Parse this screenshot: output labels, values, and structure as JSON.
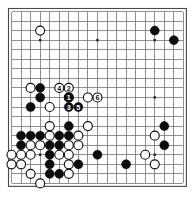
{
  "diagram": {
    "kind": "go-board-diagram",
    "board_size": 19,
    "geometry": {
      "canvas_width": 195,
      "canvas_height": 202,
      "origin_x": 11.5,
      "origin_y": 11.5,
      "step": 9.55,
      "stone_radius": 4.5,
      "frame_inset": 3.0
    },
    "colors": {
      "background": "#ffffff",
      "grid_line": "#6b6b6b",
      "frame": "#4a4a4a",
      "black_stone": "#0d0d0d",
      "white_stone": "#ffffff",
      "white_stone_outline": "#111111",
      "star_point": "#2a2a2a",
      "label_on_black": "#ffffff",
      "label_on_white": "#0d0d0d"
    },
    "star_points": [
      {
        "col": 4,
        "row": 4
      },
      {
        "col": 10,
        "row": 4
      },
      {
        "col": 16,
        "row": 4
      },
      {
        "col": 4,
        "row": 10
      },
      {
        "col": 10,
        "row": 10
      },
      {
        "col": 16,
        "row": 10
      },
      {
        "col": 4,
        "row": 16
      },
      {
        "col": 10,
        "row": 16
      },
      {
        "col": 16,
        "row": 16
      }
    ],
    "stones": [
      {
        "col": 4,
        "row": 3,
        "color": "white"
      },
      {
        "col": 16,
        "row": 3,
        "color": "black"
      },
      {
        "col": 18,
        "row": 4,
        "color": "black"
      },
      {
        "col": 3,
        "row": 9,
        "color": "white"
      },
      {
        "col": 4,
        "row": 9,
        "color": "black"
      },
      {
        "col": 4,
        "row": 10,
        "color": "black"
      },
      {
        "col": 3,
        "row": 11,
        "color": "black"
      },
      {
        "col": 5,
        "row": 11,
        "color": "white"
      },
      {
        "col": 7,
        "row": 10,
        "color": "white"
      },
      {
        "col": 9,
        "row": 10,
        "color": "white"
      },
      {
        "col": 5,
        "row": 13,
        "color": "white"
      },
      {
        "col": 7,
        "row": 13,
        "color": "black"
      },
      {
        "col": 9,
        "row": 13,
        "color": "white"
      },
      {
        "col": 2,
        "row": 14,
        "color": "black"
      },
      {
        "col": 3,
        "row": 14,
        "color": "black"
      },
      {
        "col": 4,
        "row": 14,
        "color": "black"
      },
      {
        "col": 5,
        "row": 14,
        "color": "white"
      },
      {
        "col": 6,
        "row": 14,
        "color": "black"
      },
      {
        "col": 7,
        "row": 14,
        "color": "black"
      },
      {
        "col": 8,
        "row": 14,
        "color": "white"
      },
      {
        "col": 2,
        "row": 15,
        "color": "black"
      },
      {
        "col": 3,
        "row": 15,
        "color": "white"
      },
      {
        "col": 4,
        "row": 15,
        "color": "white"
      },
      {
        "col": 5,
        "row": 15,
        "color": "black"
      },
      {
        "col": 6,
        "row": 15,
        "color": "black"
      },
      {
        "col": 7,
        "row": 15,
        "color": "white"
      },
      {
        "col": 8,
        "row": 15,
        "color": "white"
      },
      {
        "col": 1,
        "row": 16,
        "color": "white"
      },
      {
        "col": 2,
        "row": 16,
        "color": "white"
      },
      {
        "col": 3,
        "row": 16,
        "color": "white"
      },
      {
        "col": 5,
        "row": 16,
        "color": "black"
      },
      {
        "col": 6,
        "row": 16,
        "color": "white"
      },
      {
        "col": 7,
        "row": 16,
        "color": "white"
      },
      {
        "col": 1,
        "row": 17,
        "color": "white"
      },
      {
        "col": 2,
        "row": 17,
        "color": "white"
      },
      {
        "col": 5,
        "row": 17,
        "color": "black"
      },
      {
        "col": 7,
        "row": 17,
        "color": "white"
      },
      {
        "col": 8,
        "row": 17,
        "color": "black"
      },
      {
        "col": 3,
        "row": 18,
        "color": "white"
      },
      {
        "col": 5,
        "row": 18,
        "color": "black"
      },
      {
        "col": 6,
        "row": 18,
        "color": "black"
      },
      {
        "col": 7,
        "row": 18,
        "color": "white"
      },
      {
        "col": 4,
        "row": 19,
        "color": "white"
      },
      {
        "col": 10,
        "row": 16,
        "color": "black"
      },
      {
        "col": 13,
        "row": 17,
        "color": "black"
      },
      {
        "col": 17,
        "row": 13,
        "color": "black"
      },
      {
        "col": 16,
        "row": 14,
        "color": "white"
      },
      {
        "col": 17,
        "row": 15,
        "color": "black"
      },
      {
        "col": 15,
        "row": 16,
        "color": "white"
      },
      {
        "col": 16,
        "row": 17,
        "color": "white"
      }
    ],
    "move_stones": [
      {
        "number": "4",
        "col": 6,
        "row": 9,
        "color": "white"
      },
      {
        "number": "2",
        "col": 7,
        "row": 9,
        "color": "white"
      },
      {
        "number": "1",
        "col": 7,
        "row": 10,
        "color": "black"
      },
      {
        "number": "6",
        "col": 10,
        "row": 10,
        "color": "white"
      },
      {
        "number": "3",
        "col": 7,
        "row": 11,
        "color": "black"
      },
      {
        "number": "5",
        "col": 8,
        "row": 11,
        "color": "black"
      }
    ]
  }
}
